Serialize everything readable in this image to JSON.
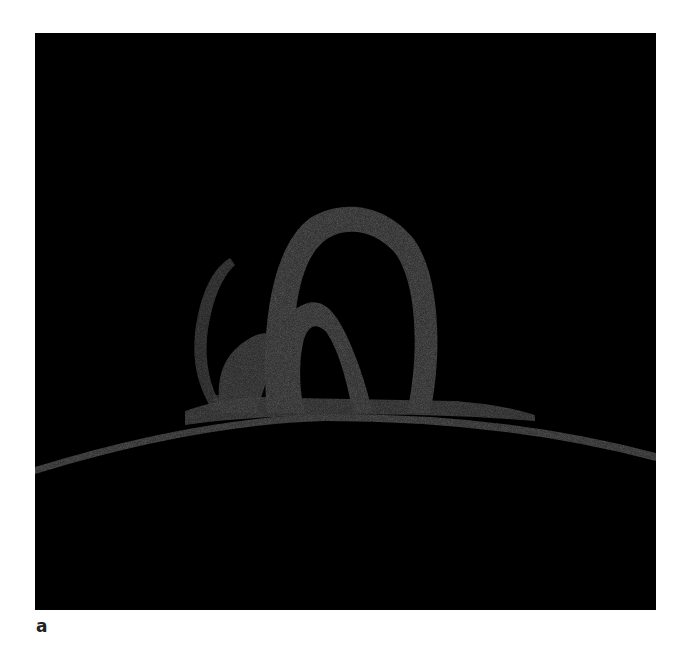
{
  "figure": {
    "panel_label": "a",
    "colors": {
      "background": "#000000",
      "plasma": "#4a4a4a",
      "page": "#ffffff"
    }
  }
}
